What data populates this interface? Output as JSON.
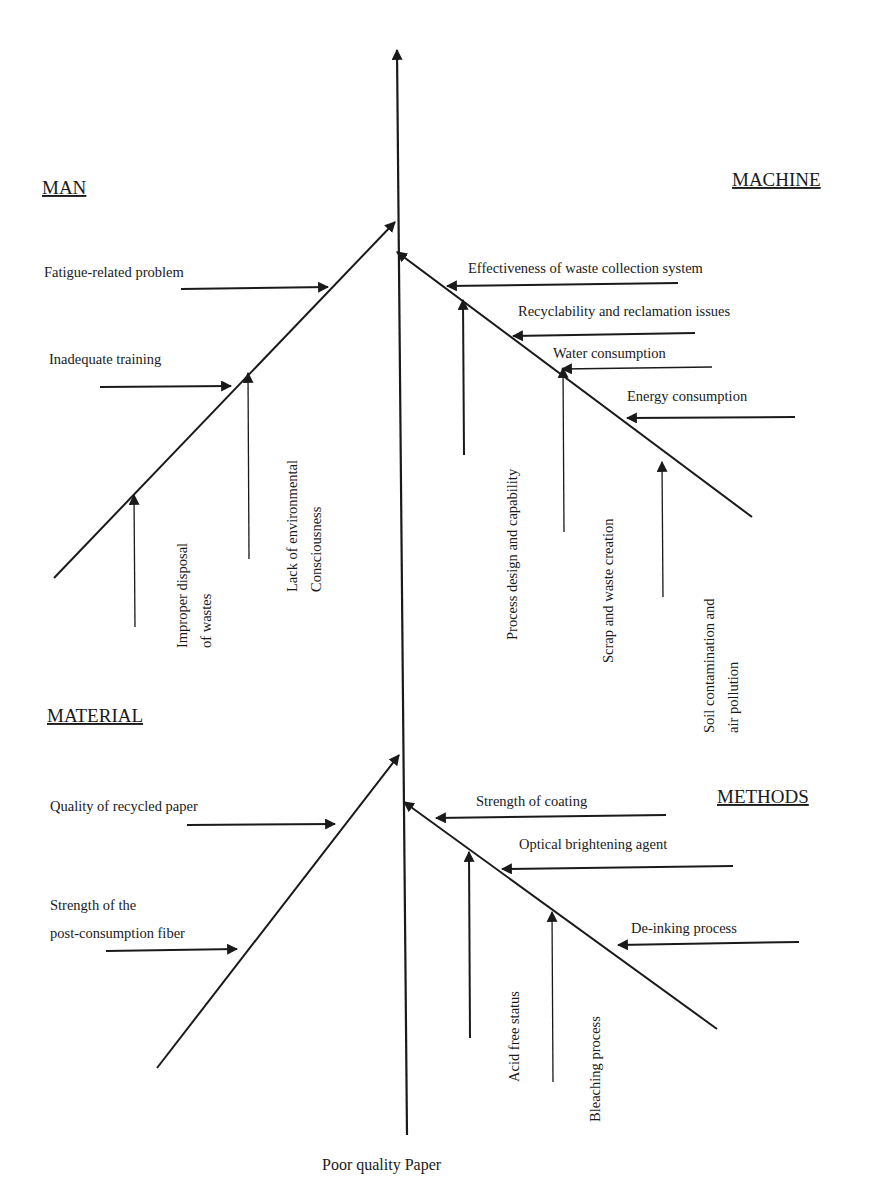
{
  "diagram": {
    "type": "fishbone",
    "effect": {
      "label": "Poor quality Paper",
      "x": 322,
      "y": 1170
    },
    "spine": {
      "x1": 407,
      "y1": 1135,
      "x2": 397,
      "y2": 50,
      "w": 2.2
    },
    "categories": [
      {
        "id": "man",
        "label": "MAN",
        "x": 42,
        "y": 194
      },
      {
        "id": "machine",
        "label": "MACHINE",
        "x": 732,
        "y": 186
      },
      {
        "id": "material",
        "label": "MATERIAL",
        "x": 47,
        "y": 722
      },
      {
        "id": "methods",
        "label": "METHODS",
        "x": 717,
        "y": 803
      }
    ],
    "bones": [
      {
        "id": "man-bone",
        "x1": 54,
        "y1": 578,
        "x2": 395,
        "y2": 222,
        "arrow": true,
        "w": 2
      },
      {
        "id": "machine-bone",
        "x1": 752,
        "y1": 517,
        "x2": 397,
        "y2": 252,
        "arrow": true,
        "w": 2
      },
      {
        "id": "material-bone",
        "x1": 157,
        "y1": 1068,
        "x2": 399,
        "y2": 755,
        "arrow": true,
        "w": 2
      },
      {
        "id": "methods-bone",
        "x1": 717,
        "y1": 1029,
        "x2": 404,
        "y2": 802,
        "arrow": true,
        "w": 2
      }
    ],
    "causes": [
      {
        "category": "man",
        "label": "Fatigue-related problem",
        "orient": "h",
        "tx": 44,
        "ty": 277,
        "x1": 181,
        "y1": 289,
        "x2": 328,
        "y2": 287,
        "w": 2
      },
      {
        "category": "man",
        "label": "Inadequate training",
        "orient": "h",
        "tx": 49,
        "ty": 364,
        "x1": 100,
        "y1": 387,
        "x2": 231,
        "y2": 386,
        "w": 2
      },
      {
        "category": "man",
        "label": "Improper disposal",
        "label2": "of wastes",
        "orient": "v",
        "tx": 187,
        "ty": 648,
        "x1": 135,
        "y1": 627,
        "x2": 134,
        "y2": 495,
        "w": 1.3
      },
      {
        "category": "man",
        "label": "Lack of environmental",
        "label2": "Consciousness",
        "orient": "v",
        "tx": 297,
        "ty": 592,
        "x1": 249,
        "y1": 559,
        "x2": 248,
        "y2": 373,
        "w": 1.3
      },
      {
        "category": "machine",
        "label": "Effectiveness of waste collection system",
        "orient": "h",
        "tx": 468,
        "ty": 273,
        "x1": 678,
        "y1": 283,
        "x2": 447,
        "y2": 286,
        "w": 2
      },
      {
        "category": "machine",
        "label": "Recyclability and reclamation issues",
        "orient": "h",
        "tx": 518,
        "ty": 316,
        "x1": 695,
        "y1": 333,
        "x2": 513,
        "y2": 336,
        "w": 2
      },
      {
        "category": "machine",
        "label": "Water consumption",
        "orient": "h",
        "tx": 553,
        "ty": 358,
        "x1": 712,
        "y1": 367,
        "x2": 562,
        "y2": 369,
        "w": 1.6
      },
      {
        "category": "machine",
        "label": "Energy consumption",
        "orient": "h",
        "tx": 627,
        "ty": 401,
        "x1": 795,
        "y1": 417,
        "x2": 627,
        "y2": 418,
        "w": 2
      },
      {
        "category": "machine",
        "label": "Process design and capability",
        "orient": "v",
        "tx": 517,
        "ty": 640,
        "x1": 464,
        "y1": 455,
        "x2": 463,
        "y2": 300,
        "w": 2
      },
      {
        "category": "machine",
        "label": "Scrap and waste creation",
        "orient": "v",
        "tx": 613,
        "ty": 663,
        "x1": 564,
        "y1": 532,
        "x2": 563,
        "y2": 368,
        "w": 1.3
      },
      {
        "category": "machine",
        "label": "Soil contamination and",
        "label2": "air pollution",
        "orient": "v",
        "tx": 714,
        "ty": 733,
        "x1": 663,
        "y1": 597,
        "x2": 662,
        "y2": 462,
        "w": 1.3
      },
      {
        "category": "material",
        "label": "Quality of recycled paper",
        "orient": "h",
        "tx": 50,
        "ty": 811,
        "x1": 187,
        "y1": 825,
        "x2": 335,
        "y2": 824,
        "w": 2
      },
      {
        "category": "material",
        "label": "Strength of the",
        "label2": "post-consumption fiber",
        "orient": "h2",
        "tx": 50,
        "ty": 910,
        "x1": 106,
        "y1": 951,
        "x2": 237,
        "y2": 949,
        "w": 2
      },
      {
        "category": "methods",
        "label": "Strength of coating",
        "orient": "h",
        "tx": 476,
        "ty": 806,
        "x1": 666,
        "y1": 815,
        "x2": 436,
        "y2": 818,
        "w": 2
      },
      {
        "category": "methods",
        "label": "Optical brightening agent",
        "orient": "h",
        "tx": 519,
        "ty": 849,
        "x1": 733,
        "y1": 866,
        "x2": 502,
        "y2": 869,
        "w": 2
      },
      {
        "category": "methods",
        "label": "De-inking process",
        "orient": "h",
        "tx": 631,
        "ty": 933,
        "x1": 799,
        "y1": 942,
        "x2": 618,
        "y2": 945,
        "w": 2
      },
      {
        "category": "methods",
        "label": "Acid free status",
        "orient": "v",
        "tx": 519,
        "ty": 1082,
        "x1": 470,
        "y1": 1038,
        "x2": 469,
        "y2": 852,
        "w": 2
      },
      {
        "category": "methods",
        "label": "Bleaching process",
        "orient": "v",
        "tx": 600,
        "ty": 1122,
        "x1": 553,
        "y1": 1082,
        "x2": 552,
        "y2": 912,
        "w": 1.3
      }
    ]
  }
}
